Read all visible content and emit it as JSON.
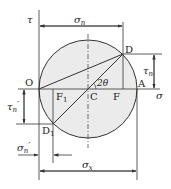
{
  "diagram": {
    "colors": {
      "circle_fill": "#ebebeb",
      "line": "#333333"
    },
    "axes": {
      "tau_label": "τ",
      "sigma_label": "σ"
    },
    "points": {
      "O": "O",
      "C": "C",
      "A": "A",
      "D": "D",
      "D1": "D",
      "D1_sub": "1",
      "F": "F",
      "F1": "F",
      "F1_sub": "1"
    },
    "angle_label": "2θ",
    "dimensions": {
      "sigma_n": "σ",
      "sigma_n_sub": "n",
      "tau_n": "τ",
      "tau_n_sub": "n",
      "tau_n_prime": "τ",
      "tau_n_prime_sub": "n",
      "prime": "′",
      "sigma_n_prime": "σ",
      "sigma_n_prime_sub": "n",
      "sigma_x": "σ",
      "sigma_x_sub": "x"
    }
  }
}
